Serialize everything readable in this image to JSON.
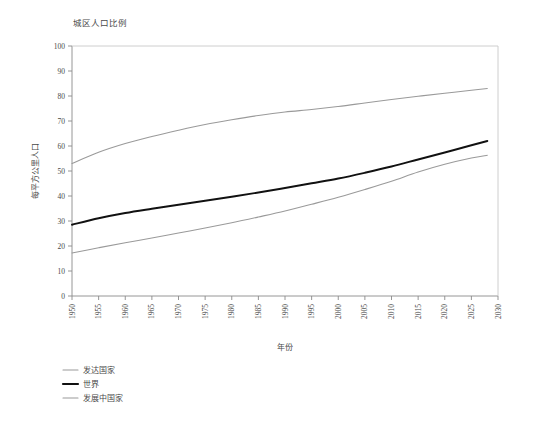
{
  "chart_data": {
    "type": "line",
    "title": "城区人口比例",
    "xlabel": "年份",
    "ylabel": "每平方公里人口",
    "xlim": [
      1950,
      2030
    ],
    "ylim": [
      0,
      100
    ],
    "grid": false,
    "legend_position": "below-left",
    "x_ticks": [
      1950,
      1955,
      1960,
      1965,
      1970,
      1975,
      1980,
      1985,
      1990,
      1995,
      2000,
      2005,
      2010,
      2015,
      2020,
      2025,
      2030
    ],
    "y_ticks": [
      0,
      10,
      20,
      30,
      40,
      50,
      60,
      70,
      80,
      90,
      100
    ],
    "x": [
      1950,
      1955,
      1960,
      1965,
      1970,
      1975,
      1980,
      1985,
      1990,
      1995,
      2000,
      2005,
      2010,
      2015,
      2020,
      2025,
      2028
    ],
    "series": [
      {
        "name": "发达国家",
        "color": "#9a9a9a",
        "width": 1.1,
        "values": [
          53.0,
          57.5,
          61.0,
          63.8,
          66.3,
          68.6,
          70.5,
          72.2,
          73.6,
          74.6,
          75.8,
          77.2,
          78.6,
          79.9,
          81.1,
          82.3,
          83.0
        ]
      },
      {
        "name": "世界",
        "color": "#111111",
        "width": 1.9,
        "values": [
          28.5,
          31.1,
          33.2,
          34.9,
          36.5,
          38.1,
          39.7,
          41.4,
          43.2,
          45.1,
          47.0,
          49.3,
          51.8,
          54.6,
          57.4,
          60.3,
          62.0
        ]
      },
      {
        "name": "发展中国家",
        "color": "#9a9a9a",
        "width": 1.1,
        "values": [
          17.2,
          19.3,
          21.3,
          23.2,
          25.2,
          27.2,
          29.3,
          31.6,
          34.0,
          36.7,
          39.5,
          42.6,
          45.9,
          49.6,
          52.7,
          55.2,
          56.3
        ]
      }
    ]
  },
  "legend": {
    "items": [
      {
        "label": "发达国家",
        "color": "#9a9a9a",
        "width": 1.1
      },
      {
        "label": "世界",
        "color": "#111111",
        "width": 2.2
      },
      {
        "label": "发展中国家",
        "color": "#9a9a9a",
        "width": 1.1
      }
    ]
  }
}
